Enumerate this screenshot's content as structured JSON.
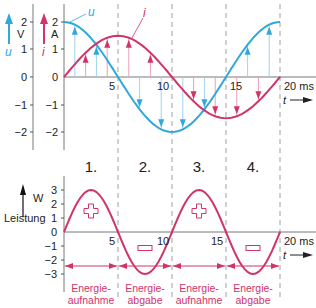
{
  "chart_data": [
    {
      "type": "line",
      "title": "",
      "xlabel": "t",
      "x_unit": "ms",
      "x_ticks": [
        5,
        10,
        15,
        20
      ],
      "x_range": [
        0,
        20
      ],
      "left_axis": {
        "symbol": "u",
        "unit": "V",
        "ticks": [
          2,
          1,
          0,
          -1,
          -2
        ]
      },
      "right_axis": {
        "symbol": "i",
        "unit": "A",
        "ticks": [
          2,
          1,
          0,
          -1,
          -2
        ]
      },
      "series": [
        {
          "name": "u",
          "color": "#31a8dc",
          "form": "2*cos(2*pi*t/20)",
          "amplitude": 2,
          "unit": "V",
          "x": [
            0,
            2.5,
            5,
            7.5,
            10,
            12.5,
            15,
            17.5,
            20
          ],
          "values": [
            2,
            1.41,
            0,
            -1.41,
            -2,
            -1.41,
            0,
            1.41,
            2
          ]
        },
        {
          "name": "i",
          "color": "#d1346a",
          "form": "1.5*sin(2*pi*t/20)",
          "amplitude": 1.5,
          "unit": "A",
          "x": [
            0,
            2.5,
            5,
            7.5,
            10,
            12.5,
            15,
            17.5,
            20
          ],
          "values": [
            0,
            1.06,
            1.5,
            1.06,
            0,
            -1.06,
            -1.5,
            -1.06,
            0
          ]
        }
      ],
      "phase_lines_ms": [
        5,
        10,
        15,
        20
      ]
    },
    {
      "type": "line",
      "title": "",
      "xlabel": "t",
      "x_unit": "ms",
      "ylabel": "Leistung",
      "y_unit": "W",
      "x_ticks": [
        5,
        10,
        15,
        20
      ],
      "y_ticks": [
        3,
        2,
        1,
        0,
        -1,
        -2,
        -3
      ],
      "x_range": [
        0,
        20
      ],
      "series": [
        {
          "name": "Leistung p = u·i",
          "color": "#d1346a",
          "form": "3*sin(4*pi*t/20)",
          "x": [
            0,
            2.5,
            5,
            7.5,
            10,
            12.5,
            15,
            17.5,
            20
          ],
          "values": [
            0,
            3,
            0,
            -3,
            0,
            3,
            0,
            -3,
            0
          ]
        }
      ],
      "annotations": [
        "+",
        "−",
        "+",
        "−"
      ]
    }
  ],
  "top": {
    "u_label": "u",
    "i_label": "i",
    "v_unit": "V",
    "a_unit": "A",
    "left_ticks": [
      "2",
      "1",
      "0",
      "−1",
      "−2"
    ],
    "right_ticks": [
      "2",
      "1",
      "0",
      "−1",
      "−2"
    ],
    "x_ticks": [
      "5",
      "10",
      "15"
    ],
    "x_end": "20 ms",
    "t_label": "t"
  },
  "phases": [
    "1.",
    "2.",
    "3.",
    "4."
  ],
  "bottom": {
    "unit": "W",
    "ylabel": "Leistung",
    "y_ticks": [
      "3",
      "2",
      "1",
      "0",
      "−1",
      "−2",
      "−3"
    ],
    "x_ticks": [
      "5",
      "10",
      "15"
    ],
    "x_end": "20 ms",
    "t_label": "t",
    "plus": "+",
    "minus": "−"
  },
  "energy": [
    {
      "line1": "Energie-",
      "line2": "aufnahme"
    },
    {
      "line1": "Energie-",
      "line2": "abgabe"
    },
    {
      "line1": "Energie-",
      "line2": "aufnahme"
    },
    {
      "line1": "Energie-",
      "line2": "abgabe"
    }
  ]
}
